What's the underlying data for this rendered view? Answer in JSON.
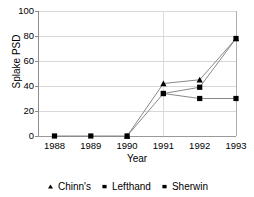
{
  "chart_data": {
    "type": "line",
    "title": "",
    "xlabel": "Year",
    "ylabel": "Splake PSD",
    "categories": [
      "1988",
      "1989",
      "1990",
      "1991",
      "1992",
      "1993"
    ],
    "ylim": [
      0,
      100
    ],
    "yticks": [
      0,
      20,
      40,
      60,
      80,
      100
    ],
    "ytick_labels": [
      "0",
      "20",
      "40",
      "60",
      "80",
      "100"
    ],
    "grid": "horizontal-gridlines-plus-vertical-at-1991-and-1993",
    "legend_position": "bottom-center",
    "series": [
      {
        "name": "Chinn's",
        "marker": "triangle",
        "color": "#000000",
        "x": [
          "1990",
          "1991",
          "1992",
          "1993"
        ],
        "values": [
          0,
          42,
          45,
          78
        ]
      },
      {
        "name": "Lefthand",
        "marker": "square",
        "color": "#000000",
        "x": [
          "1988",
          "1989",
          "1990",
          "1991",
          "1992",
          "1993"
        ],
        "values": [
          0,
          0,
          0,
          34,
          39,
          78
        ]
      },
      {
        "name": "Sherwin",
        "marker": "square",
        "color": "#000000",
        "x": [
          "1991",
          "1992",
          "1993"
        ],
        "values": [
          34,
          30,
          30
        ]
      }
    ]
  },
  "legend": {
    "entries": [
      {
        "label": "Chinn's",
        "marker": "triangle-marker"
      },
      {
        "label": "Lefthand",
        "marker": "square-marker"
      },
      {
        "label": "Sherwin",
        "marker": "square-marker"
      }
    ]
  },
  "axes": {
    "y_title": "Splake PSD",
    "x_title": "Year"
  }
}
